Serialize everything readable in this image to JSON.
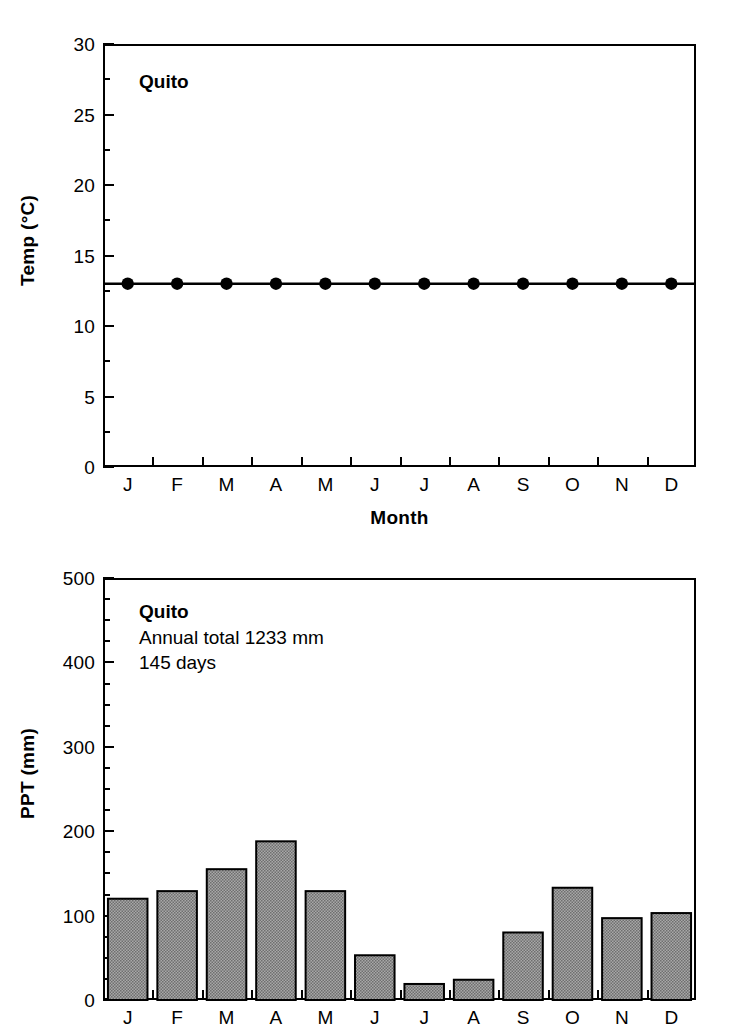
{
  "figure": {
    "station": "Quito",
    "background_color": "#ffffff",
    "ink_color": "#000000",
    "bar_fill_color": "#a8a8a8"
  },
  "chart_data": [
    {
      "type": "line",
      "title": "Quito",
      "xlabel": "Month",
      "ylabel": "Temp (°C)",
      "ylabel_text": "Temp (",
      "ylabel_unit": "°C)",
      "categories": [
        "J",
        "F",
        "M",
        "A",
        "M",
        "J",
        "J",
        "A",
        "S",
        "O",
        "N",
        "D"
      ],
      "values": [
        13,
        13,
        13,
        13,
        13,
        13,
        13,
        13,
        13,
        13,
        13,
        13
      ],
      "ylim": [
        0,
        30
      ],
      "ytick_labels": [
        "0",
        "5",
        "10",
        "15",
        "20",
        "25",
        "30"
      ],
      "ytick_values": [
        0,
        5,
        10,
        15,
        20,
        25,
        30
      ],
      "yminor_step": 2.5,
      "grid": "off",
      "legend": "none",
      "marker": "filled-circle",
      "annotations": [
        "Quito"
      ]
    },
    {
      "type": "bar",
      "title": "Quito",
      "xlabel": "Month",
      "ylabel": "PPT (mm)",
      "categories": [
        "J",
        "F",
        "M",
        "A",
        "M",
        "J",
        "J",
        "A",
        "S",
        "O",
        "N",
        "D"
      ],
      "values": [
        120,
        129,
        155,
        188,
        129,
        53,
        19,
        24,
        80,
        133,
        97,
        103
      ],
      "ylim": [
        0,
        500
      ],
      "ytick_labels": [
        "0",
        "100",
        "200",
        "300",
        "400",
        "500"
      ],
      "ytick_values": [
        0,
        100,
        200,
        300,
        400,
        500
      ],
      "yminor_step": 25,
      "grid": "off",
      "legend": "none",
      "annotations": [
        "Quito",
        "Annual total 1233 mm",
        "145 days"
      ]
    }
  ],
  "temp_panel": {
    "annotation_title": "Quito",
    "y_axis_title_main": "Temp (",
    "y_axis_title_unit": "°C)",
    "x_axis_title": "Month",
    "y_tick_labels": [
      "30",
      "25",
      "20",
      "15",
      "10",
      "5",
      "0"
    ],
    "x_tick_labels": [
      "J",
      "F",
      "M",
      "A",
      "M",
      "J",
      "J",
      "A",
      "S",
      "O",
      "N",
      "D"
    ]
  },
  "ppt_panel": {
    "annotation_title": "Quito",
    "annotation_line_1": "Annual total 1233 mm",
    "annotation_line_2": "145 days",
    "y_axis_title": "PPT (mm)",
    "y_tick_labels": [
      "500",
      "400",
      "300",
      "200",
      "100",
      "0"
    ],
    "x_tick_labels": [
      "J",
      "F",
      "M",
      "A",
      "M",
      "J",
      "J",
      "A",
      "S",
      "O",
      "N",
      "D"
    ]
  }
}
